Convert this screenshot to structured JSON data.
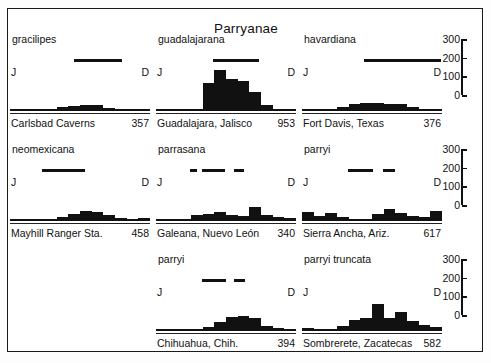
{
  "figure": {
    "title": "Parryanae",
    "month_start_label": "J",
    "month_end_label": "D"
  },
  "axis": {
    "ticks": [
      "300",
      "200",
      "100",
      "0"
    ],
    "ymax": 300,
    "ymin": 0
  },
  "panels": [
    {
      "species": "gracilipes",
      "locality": "Carlsbad Caverns",
      "count": "357",
      "bloom_bars": [
        [
          0.455,
          0.345
        ]
      ],
      "values": [
        3,
        3,
        4,
        10,
        22,
        30,
        40,
        35,
        20,
        4,
        3,
        3
      ]
    },
    {
      "species": "guadalajarana",
      "locality": "Guadalajara, Jalisco",
      "count": "953",
      "bloom_bars": [
        [
          0.405,
          0.33
        ]
      ],
      "values": [
        10,
        6,
        4,
        4,
        175,
        255,
        200,
        190,
        120,
        35,
        6,
        5
      ]
    },
    {
      "species": "havardiana",
      "locality": "Fort Davis, Texas",
      "count": "376",
      "bloom_bars": [
        [
          0.445,
          0.545
        ]
      ],
      "values": [
        6,
        6,
        5,
        24,
        42,
        48,
        52,
        44,
        42,
        26,
        6,
        5
      ]
    },
    {
      "species": "neomexicana",
      "locality": "Mayhill Ranger Sta.",
      "count": "458",
      "bloom_bars": [
        [
          0.225,
          0.31
        ]
      ],
      "values": [
        5,
        5,
        5,
        10,
        28,
        46,
        60,
        56,
        35,
        20,
        8,
        16
      ]
    },
    {
      "species": "parrasana",
      "locality": "Galeana, Nuevo León",
      "count": "340",
      "bloom_bars": [
        [
          0.245,
          0.05
        ],
        [
          0.33,
          0.16
        ],
        [
          0.56,
          0.07
        ]
      ],
      "values": [
        6,
        6,
        4,
        36,
        44,
        54,
        36,
        34,
        86,
        40,
        22,
        16
      ]
    },
    {
      "species": "parryi",
      "locality": "Sierra Ancha, Ariz.",
      "count": "617",
      "bloom_bars": [
        [
          0.33,
          0.18
        ],
        [
          0.58,
          0.085
        ]
      ],
      "values": [
        58,
        34,
        50,
        26,
        10,
        4,
        44,
        74,
        50,
        34,
        26,
        62
      ]
    },
    {
      "species": "parryi",
      "locality": "Chihuahua, Chih.",
      "count": "394",
      "bloom_bars": [
        [
          0.33,
          0.17
        ],
        [
          0.56,
          0.075
        ]
      ],
      "values": [
        4,
        4,
        4,
        6,
        26,
        56,
        90,
        94,
        84,
        34,
        16,
        6
      ]
    },
    {
      "species": "parryi truncata",
      "locality": "Sombrerete, Zacatecas",
      "count": "582",
      "bloom_bars": [],
      "values": [
        16,
        10,
        10,
        34,
        70,
        80,
        168,
        84,
        120,
        60,
        36,
        26
      ]
    }
  ],
  "panel_positions": [
    "r0 c0",
    "r0 c1",
    "r0 c2",
    "r1 c0",
    "r1 c1",
    "r1 c2",
    "r2 c1",
    "r2 c2"
  ],
  "chart_data": {
    "type": "bar",
    "title": "Parryanae",
    "xlabel": "Month (January – December)",
    "ylabel": "Number of flowering records",
    "ylim": [
      0,
      300
    ],
    "grid": false,
    "legend": "none",
    "categories": [
      "J",
      "F",
      "M",
      "A",
      "M",
      "J",
      "J",
      "A",
      "S",
      "O",
      "N",
      "D"
    ],
    "axis_ticks": [
      0,
      100,
      200,
      300
    ],
    "panel_layout": "3 columns × 3 rows (bottom-left cell empty)",
    "series": [
      {
        "name": "gracilipes — Carlsbad Caverns (357)",
        "values": [
          3,
          3,
          4,
          10,
          22,
          30,
          40,
          35,
          20,
          4,
          3,
          3
        ],
        "bloom_period": "late May – August"
      },
      {
        "name": "guadalajarana — Guadalajara, Jalisco (953)",
        "values": [
          10,
          6,
          4,
          4,
          175,
          255,
          200,
          190,
          120,
          35,
          6,
          5
        ],
        "bloom_period": "May – August"
      },
      {
        "name": "havardiana — Fort Davis, Texas (376)",
        "values": [
          6,
          6,
          5,
          24,
          42,
          48,
          52,
          44,
          42,
          26,
          6,
          5
        ],
        "bloom_period": "late May – December"
      },
      {
        "name": "neomexicana — Mayhill Ranger Sta. (458)",
        "values": [
          5,
          5,
          5,
          10,
          28,
          46,
          60,
          56,
          35,
          20,
          8,
          16
        ],
        "bloom_period": "March – June"
      },
      {
        "name": "parrasana — Galeana, Nuevo León (340)",
        "values": [
          6,
          6,
          4,
          36,
          44,
          54,
          36,
          34,
          86,
          40,
          22,
          16
        ],
        "bloom_period": "segmented: April; May – June; August"
      },
      {
        "name": "parryi — Sierra Ancha, Ariz. (617)",
        "values": [
          58,
          34,
          50,
          26,
          10,
          4,
          44,
          74,
          50,
          34,
          26,
          62
        ],
        "bloom_period": "segmented: May – June; August"
      },
      {
        "name": "parryi — Chihuahua, Chih. (394)",
        "values": [
          4,
          4,
          4,
          6,
          26,
          56,
          90,
          94,
          84,
          34,
          16,
          6
        ],
        "bloom_period": "segmented: May – June; August"
      },
      {
        "name": "parryi truncata — Sombrerete, Zacatecas (582)",
        "values": [
          16,
          10,
          10,
          34,
          70,
          80,
          168,
          84,
          120,
          60,
          36,
          26
        ],
        "bloom_period": "not shown"
      }
    ]
  }
}
